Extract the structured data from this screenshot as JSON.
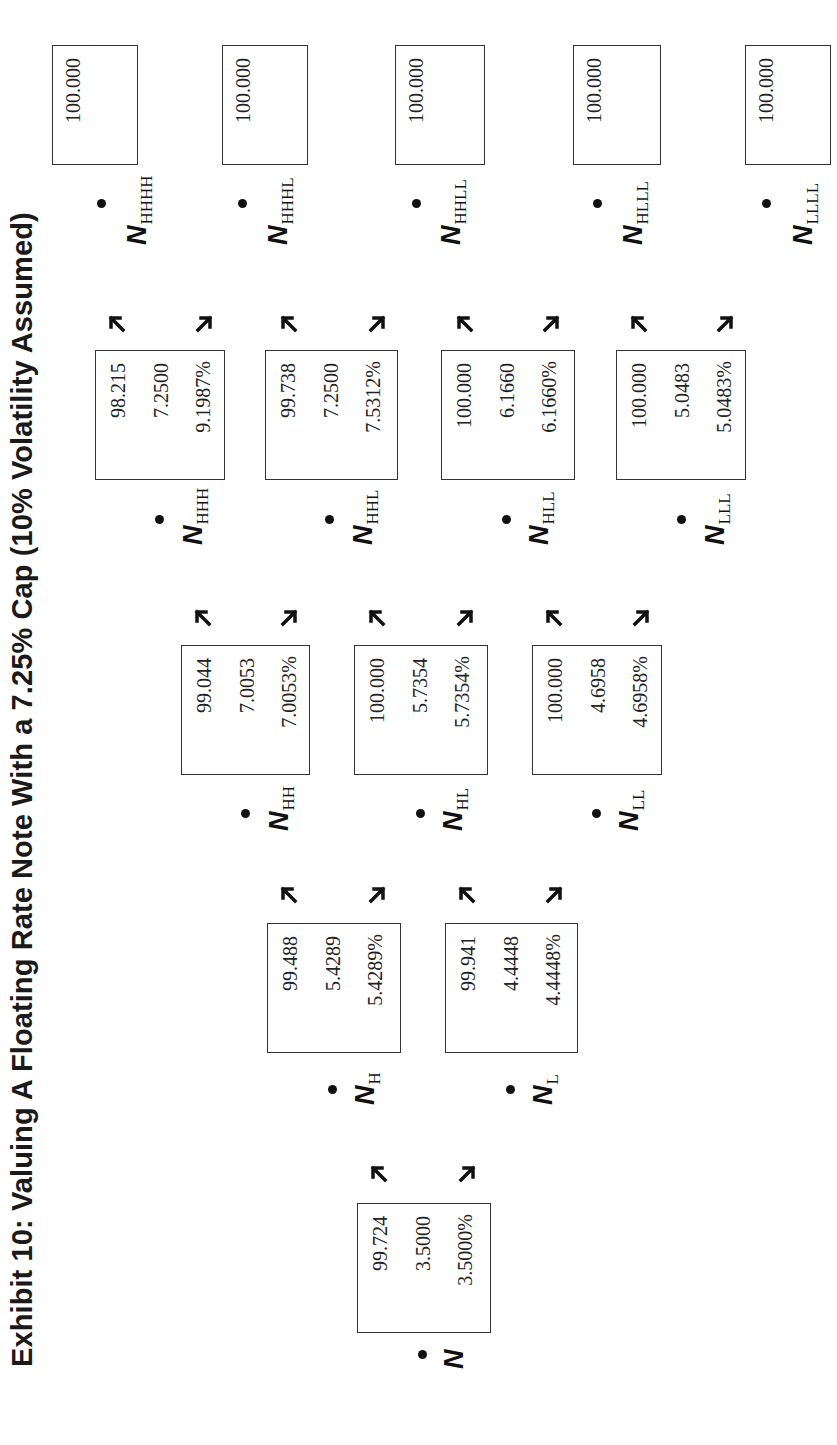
{
  "title": "Exhibit 10: Valuing A Floating Rate Note With a 7.25% Cap (10% Volatility Assumed)",
  "nodes": {
    "N": {
      "label": "N",
      "sub": "",
      "value": "99.724",
      "cash_flow": "3.5000",
      "rate": "3.5000%"
    },
    "NH": {
      "label": "N",
      "sub": "H",
      "value": "99.488",
      "cash_flow": "5.4289",
      "rate": "5.4289%"
    },
    "NL": {
      "label": "N",
      "sub": "L",
      "value": "99.941",
      "cash_flow": "4.4448",
      "rate": "4.4448%"
    },
    "NHH": {
      "label": "N",
      "sub": "HH",
      "value": "99.044",
      "cash_flow": "7.0053",
      "rate": "7.0053%"
    },
    "NHL": {
      "label": "N",
      "sub": "HL",
      "value": "100.000",
      "cash_flow": "5.7354",
      "rate": "5.7354%"
    },
    "NLL": {
      "label": "N",
      "sub": "LL",
      "value": "100.000",
      "cash_flow": "4.6958",
      "rate": "4.6958%"
    },
    "NHHH": {
      "label": "N",
      "sub": "HHH",
      "value": "98.215",
      "cash_flow": "7.2500",
      "rate": "9.1987%"
    },
    "NHHL": {
      "label": "N",
      "sub": "HHL",
      "value": "99.738",
      "cash_flow": "7.2500",
      "rate": "7.5312%"
    },
    "NHLL": {
      "label": "N",
      "sub": "HLL",
      "value": "100.000",
      "cash_flow": "6.1660",
      "rate": "6.1660%"
    },
    "NLLL": {
      "label": "N",
      "sub": "LLL",
      "value": "100.000",
      "cash_flow": "5.0483",
      "rate": "5.0483%"
    },
    "NHHHH": {
      "label": "N",
      "sub": "HHHH",
      "value": "100.000"
    },
    "NHHHL": {
      "label": "N",
      "sub": "HHHL",
      "value": "100.000"
    },
    "NHHLL": {
      "label": "N",
      "sub": "HHLL",
      "value": "100.000"
    },
    "NHLLL": {
      "label": "N",
      "sub": "HLLL",
      "value": "100.000"
    },
    "NLLLL": {
      "label": "N",
      "sub": "LLLL",
      "value": "100.000"
    }
  },
  "colors": {
    "text": "#222222",
    "border": "#333333",
    "background": "#ffffff"
  }
}
